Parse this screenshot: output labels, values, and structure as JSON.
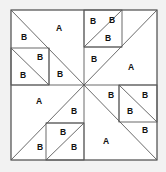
{
  "figure": {
    "colors": {
      "background": "#f2f2f2",
      "block_fill": "#ffffff",
      "frame_stroke": "#3a3a3a",
      "cut_stroke": "#5a5a5a",
      "label_color": "#111111"
    },
    "geometry": {
      "x0": 11,
      "y0": 10,
      "x1": 157,
      "y1": 160,
      "cx": 84,
      "cy": 85
    }
  },
  "labels": {
    "large_piece": "A",
    "small_piece": "B"
  },
  "pieces": [
    {
      "id": "tl-a",
      "label": "A",
      "x": 59,
      "y": 29
    },
    {
      "id": "tl-b1",
      "label": "B",
      "x": 24,
      "y": 38
    },
    {
      "id": "tl-b2",
      "label": "B",
      "x": 40,
      "y": 58
    },
    {
      "id": "tl-b3",
      "label": "B",
      "x": 23,
      "y": 76
    },
    {
      "id": "tl-b4",
      "label": "B",
      "x": 60,
      "y": 75
    },
    {
      "id": "tr-b1",
      "label": "B",
      "x": 93,
      "y": 22
    },
    {
      "id": "tr-b2",
      "label": "B",
      "x": 112,
      "y": 21
    },
    {
      "id": "tr-b3",
      "label": "B",
      "x": 108,
      "y": 39
    },
    {
      "id": "tr-b4",
      "label": "B",
      "x": 94,
      "y": 60
    },
    {
      "id": "tr-a",
      "label": "A",
      "x": 131,
      "y": 68
    },
    {
      "id": "bl-a",
      "label": "A",
      "x": 39,
      "y": 102
    },
    {
      "id": "bl-b1",
      "label": "B",
      "x": 74,
      "y": 112
    },
    {
      "id": "bl-b2",
      "label": "B",
      "x": 63,
      "y": 133
    },
    {
      "id": "bl-b3",
      "label": "B",
      "x": 40,
      "y": 148
    },
    {
      "id": "bl-b4",
      "label": "B",
      "x": 74,
      "y": 148
    },
    {
      "id": "br-b1",
      "label": "B",
      "x": 111,
      "y": 96
    },
    {
      "id": "br-b2",
      "label": "B",
      "x": 145,
      "y": 96
    },
    {
      "id": "br-b3",
      "label": "B",
      "x": 130,
      "y": 112
    },
    {
      "id": "br-b4",
      "label": "B",
      "x": 145,
      "y": 131
    },
    {
      "id": "br-a",
      "label": "A",
      "x": 106,
      "y": 142
    }
  ]
}
